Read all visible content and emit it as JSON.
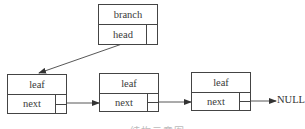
{
  "diagram": {
    "branch": {
      "title": "branch",
      "field": "head"
    },
    "leaves": [
      {
        "title": "leaf",
        "field": "next"
      },
      {
        "title": "leaf",
        "field": "next"
      },
      {
        "title": "leaf",
        "field": "next"
      }
    ],
    "terminal": "NULL",
    "caption": "结构示意图"
  }
}
